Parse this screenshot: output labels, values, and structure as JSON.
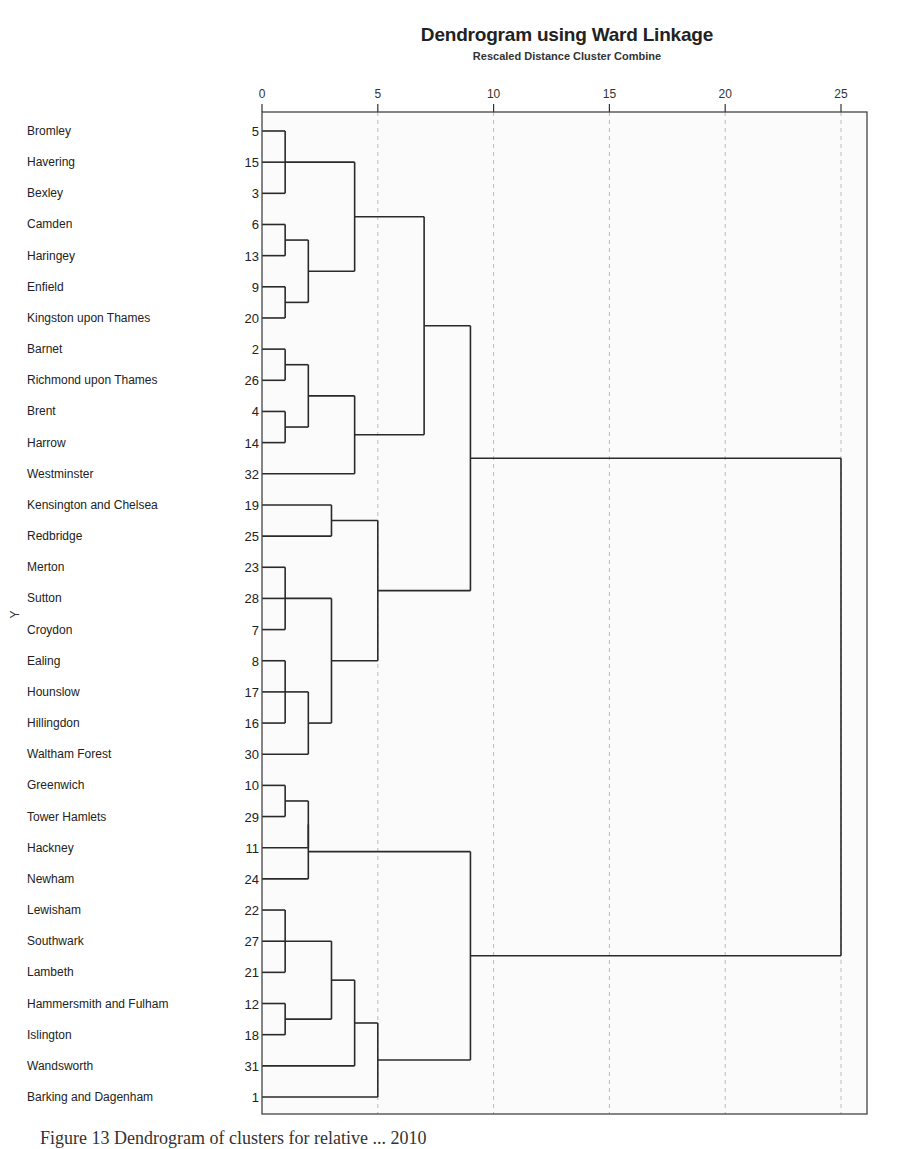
{
  "chart_data": {
    "type": "dendrogram",
    "title": "Dendrogram using Ward Linkage",
    "subtitle": "Rescaled Distance Cluster Combine",
    "xlabel": "Rescaled Distance Cluster Combine",
    "ylabel": "Y",
    "xlim": [
      0,
      25
    ],
    "x_ticks": [
      0,
      5,
      10,
      15,
      20,
      25
    ],
    "grid": "vertical dashed at 5, 10, 15, 20, 25",
    "leaves": [
      {
        "label": "Bromley",
        "id": 5
      },
      {
        "label": "Havering",
        "id": 15
      },
      {
        "label": "Bexley",
        "id": 3
      },
      {
        "label": "Camden",
        "id": 6
      },
      {
        "label": "Haringey",
        "id": 13
      },
      {
        "label": "Enfield",
        "id": 9
      },
      {
        "label": "Kingston upon Thames",
        "id": 20
      },
      {
        "label": "Barnet",
        "id": 2
      },
      {
        "label": "Richmond upon Thames",
        "id": 26
      },
      {
        "label": "Brent",
        "id": 4
      },
      {
        "label": "Harrow",
        "id": 14
      },
      {
        "label": "Westminster",
        "id": 32
      },
      {
        "label": "Kensington and Chelsea",
        "id": 19
      },
      {
        "label": "Redbridge",
        "id": 25
      },
      {
        "label": "Merton",
        "id": 23
      },
      {
        "label": "Sutton",
        "id": 28
      },
      {
        "label": "Croydon",
        "id": 7
      },
      {
        "label": "Ealing",
        "id": 8
      },
      {
        "label": "Hounslow",
        "id": 17
      },
      {
        "label": "Hillingdon",
        "id": 16
      },
      {
        "label": "Waltham Forest",
        "id": 30
      },
      {
        "label": "Greenwich",
        "id": 10
      },
      {
        "label": "Tower Hamlets",
        "id": 29
      },
      {
        "label": "Hackney",
        "id": 11
      },
      {
        "label": "Newham",
        "id": 24
      },
      {
        "label": "Lewisham",
        "id": 22
      },
      {
        "label": "Southwark",
        "id": 27
      },
      {
        "label": "Lambeth",
        "id": 21
      },
      {
        "label": "Hammersmith and Fulham",
        "id": 12
      },
      {
        "label": "Islington",
        "id": 18
      },
      {
        "label": "Wandsworth",
        "id": 31
      },
      {
        "label": "Barking and Dagenham",
        "id": 1
      }
    ],
    "merges": [
      {
        "a": "L0",
        "b": "L2",
        "height": 1,
        "name": "C_5_3"
      },
      {
        "a": "C_5_3",
        "b": "L1",
        "height": 1,
        "name": "C_5_15_3"
      },
      {
        "a": "L3",
        "b": "L4",
        "height": 1,
        "name": "C_6_13"
      },
      {
        "a": "L5",
        "b": "L6",
        "height": 1,
        "name": "C_9_20"
      },
      {
        "a": "C_6_13",
        "b": "C_9_20",
        "height": 2,
        "name": "C_6_13_9_20"
      },
      {
        "a": "C_5_15_3",
        "b": "C_6_13_9_20",
        "height": 4,
        "name": "C_top1"
      },
      {
        "a": "L7",
        "b": "L8",
        "height": 1,
        "name": "C_2_26"
      },
      {
        "a": "L9",
        "b": "L10",
        "height": 1,
        "name": "C_4_14"
      },
      {
        "a": "C_2_26",
        "b": "C_4_14",
        "height": 2,
        "name": "C_2_26_4_14"
      },
      {
        "a": "C_2_26_4_14",
        "b": "L11",
        "height": 4,
        "name": "C_top2"
      },
      {
        "a": "C_top1",
        "b": "C_top2",
        "height": 7,
        "name": "C_A"
      },
      {
        "a": "L12",
        "b": "L13",
        "height": 3,
        "name": "C_19_25"
      },
      {
        "a": "L14",
        "b": "L16",
        "height": 1,
        "name": "C_23_7"
      },
      {
        "a": "C_23_7",
        "b": "L15",
        "height": 1,
        "name": "C_23_28_7"
      },
      {
        "a": "L17",
        "b": "L19",
        "height": 1,
        "name": "C_8_16"
      },
      {
        "a": "C_8_16",
        "b": "L18",
        "height": 1,
        "name": "C_8_17_16"
      },
      {
        "a": "C_8_17_16",
        "b": "L20",
        "height": 2,
        "name": "C_8_17_16_30"
      },
      {
        "a": "C_23_28_7",
        "b": "C_8_17_16_30",
        "height": 3,
        "name": "C_mid"
      },
      {
        "a": "C_19_25",
        "b": "C_mid",
        "height": 5,
        "name": "C_B"
      },
      {
        "a": "C_A",
        "b": "C_B",
        "height": 9,
        "name": "C_AB"
      },
      {
        "a": "L21",
        "b": "L22",
        "height": 1,
        "name": "C_10_29"
      },
      {
        "a": "C_10_29",
        "b": "L23",
        "height": 2,
        "name": "C_10_29_11"
      },
      {
        "a": "C_10_29_11",
        "b": "L24",
        "height": 2,
        "name": "C_10_29_11_24"
      },
      {
        "a": "L25",
        "b": "L27",
        "height": 1,
        "name": "C_22_21"
      },
      {
        "a": "C_22_21",
        "b": "L26",
        "height": 1,
        "name": "C_22_27_21"
      },
      {
        "a": "L28",
        "b": "L29",
        "height": 1,
        "name": "C_12_18"
      },
      {
        "a": "C_22_27_21",
        "b": "C_12_18",
        "height": 3,
        "name": "C_lsh"
      },
      {
        "a": "C_lsh",
        "b": "L30",
        "height": 4,
        "name": "C_lsh_w"
      },
      {
        "a": "C_lsh_w",
        "b": "L31",
        "height": 5,
        "name": "C_south"
      },
      {
        "a": "C_10_29_11_24",
        "b": "C_south",
        "height": 9,
        "name": "C_C"
      },
      {
        "a": "C_AB",
        "b": "C_C",
        "height": 25,
        "name": "ROOT"
      }
    ]
  },
  "header": {
    "title": "Dendrogram using Ward Linkage",
    "subtitle": "Rescaled Distance Cluster Combine"
  },
  "caption": "Figure 13 Dendrogram of clusters for relative ... 2010"
}
